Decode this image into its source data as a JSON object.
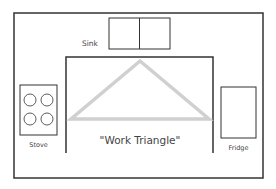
{
  "diagram": {
    "type": "kitchen-floor-plan",
    "labels": {
      "sink": "Sink",
      "stove": "Stove",
      "fridge": "Fridge",
      "center": "\"Work Triangle\""
    },
    "colors": {
      "line": "#333333",
      "triangle": "#d0d0d0",
      "text": "#444444",
      "background": "#ffffff"
    },
    "elements": [
      {
        "id": "sink",
        "label": "Sink",
        "compartments": 2
      },
      {
        "id": "stove",
        "label": "Stove",
        "burners": 4
      },
      {
        "id": "fridge",
        "label": "Fridge"
      },
      {
        "id": "work-triangle",
        "label": "\"Work Triangle\"",
        "connects": [
          "sink",
          "stove",
          "fridge"
        ]
      }
    ]
  }
}
